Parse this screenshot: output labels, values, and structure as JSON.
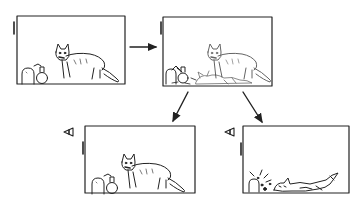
{
  "diagram": {
    "stroke_color": "#222222",
    "background": "#ffffff",
    "panels": [
      {
        "id": "initial",
        "label": "Cat alive in box with poison flask and radioactive source",
        "state": "alive",
        "observer": false
      },
      {
        "id": "superposition",
        "label": "Superposition: cat both alive and dead, flask both intact and broken",
        "state": "superposition",
        "observer": false
      },
      {
        "id": "observed-alive",
        "label": "Observed: cat alive",
        "state": "alive",
        "observer": true
      },
      {
        "id": "observed-dead",
        "label": "Observed: cat dead, flask shattered",
        "state": "dead",
        "observer": true
      }
    ],
    "arrows": [
      {
        "from": "initial",
        "to": "superposition"
      },
      {
        "from": "superposition",
        "to": "observed-alive"
      },
      {
        "from": "superposition",
        "to": "observed-dead"
      }
    ]
  }
}
